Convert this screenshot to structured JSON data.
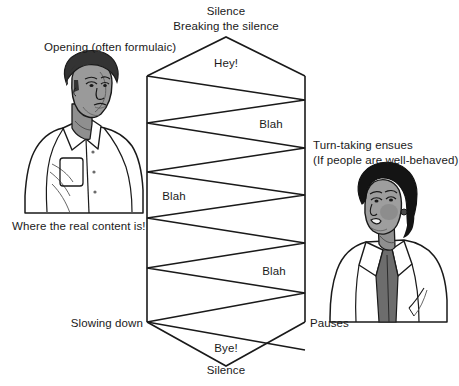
{
  "figure": {
    "title_alt": "Conversation structure diagram: two people exchanging turns",
    "background_color": "#ffffff",
    "line_color": "#1a1a1a",
    "text_color": "#1a1a1a"
  },
  "labels": {
    "silence_top": "Silence",
    "breaking_the_silence": "Breaking the silence",
    "opening": "Opening (often formulaic)",
    "hey": "Hey!",
    "blah_1": "Blah",
    "turn_taking_line1": "Turn-taking ensues",
    "turn_taking_line2": "(If people are well-behaved)",
    "blah_2": "Blah",
    "where_real_content": "Where the real content is!",
    "blah_3": "Blah",
    "slowing_down": "Slowing down",
    "pauses": "Pauses",
    "bye": "Bye!",
    "silence_bottom": "Silence"
  },
  "figures": {
    "left_person": {
      "name": "man-illustration",
      "hair_color": "#2b2b2b",
      "skin_color": "#9a9a9a",
      "garment": "collared shirt with pocket",
      "garment_color": "#ffffff"
    },
    "right_person": {
      "name": "woman-illustration",
      "hair_color": "#111111",
      "skin_color": "#9e9e9e",
      "garment": "white jacket over dark blouse",
      "garment_color": "#ffffff",
      "blouse_color": "#6d6d6d"
    }
  },
  "diagram_geometry": {
    "left_axis_x": 147,
    "right_axis_x": 305,
    "top_apex": [
      226,
      37
    ],
    "bottom_apex": [
      226,
      366
    ],
    "axis_top_y": 76,
    "axis_bottom_y": 322,
    "left_vertices_y": [
      76,
      123,
      172,
      218,
      268,
      322
    ],
    "right_vertices_y": [
      100,
      148,
      195,
      243,
      293,
      322
    ]
  }
}
